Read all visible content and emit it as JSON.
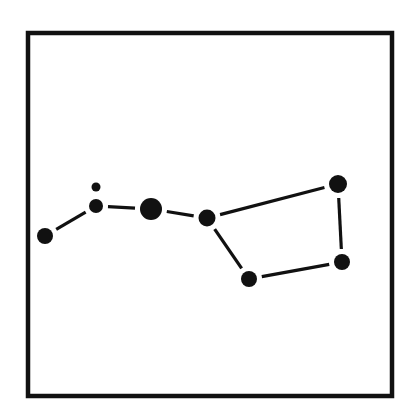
{
  "diagram": {
    "colors": {
      "background": "#ffffff",
      "ink": "#111111"
    },
    "frame": {
      "x": 28,
      "y": 33,
      "width": 364,
      "height": 363,
      "stroke_width": 4.5
    },
    "stars": [
      {
        "id": "alkaid",
        "cx": 45,
        "cy": 236,
        "r": 8
      },
      {
        "id": "mizar",
        "cx": 96,
        "cy": 206,
        "r": 7
      },
      {
        "id": "alcor",
        "cx": 96,
        "cy": 187,
        "r": 4.5
      },
      {
        "id": "alioth",
        "cx": 151,
        "cy": 209,
        "r": 11
      },
      {
        "id": "megrez",
        "cx": 207,
        "cy": 218,
        "r": 8.5
      },
      {
        "id": "dubhe",
        "cx": 338,
        "cy": 184,
        "r": 9
      },
      {
        "id": "merak",
        "cx": 342,
        "cy": 262,
        "r": 8
      },
      {
        "id": "phecda",
        "cx": 249,
        "cy": 279,
        "r": 8
      }
    ],
    "links": [
      {
        "from": "alkaid",
        "to": "mizar"
      },
      {
        "from": "mizar",
        "to": "alioth"
      },
      {
        "from": "alioth",
        "to": "megrez"
      },
      {
        "from": "megrez",
        "to": "dubhe"
      },
      {
        "from": "dubhe",
        "to": "merak"
      },
      {
        "from": "merak",
        "to": "phecda"
      },
      {
        "from": "phecda",
        "to": "megrez"
      }
    ],
    "link_gap": 5
  }
}
